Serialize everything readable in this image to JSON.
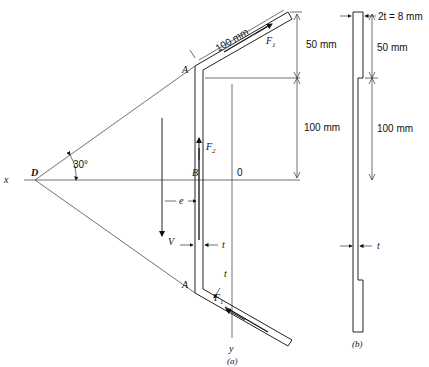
{
  "figure_a": {
    "caption": "(a)",
    "point_D": "D",
    "point_A_top": "A",
    "point_A_bottom": "A",
    "point_B": "B",
    "origin": "0",
    "axis_x": "x",
    "axis_y": "y",
    "angle": "30°",
    "flange_length": "100 mm",
    "flange_rise": "50 mm",
    "web_half_height": "100 mm",
    "force_top": "F",
    "force_top_sub": "1",
    "force_web": "F",
    "force_web_sub": "2",
    "force_bottom": "F",
    "force_bottom_sub": "1",
    "shear": "V",
    "eccentricity": "e",
    "thickness_web": "t",
    "thickness_flange": "t"
  },
  "figure_b": {
    "caption": "(b)",
    "thickness_top": "2t = 8 mm",
    "segment_top": "50 mm",
    "segment_mid": "100 mm",
    "thickness": "t"
  }
}
